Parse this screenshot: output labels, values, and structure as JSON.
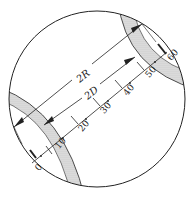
{
  "diagram": {
    "labels": {
      "outer": "2R",
      "inner": "2D"
    },
    "scale": {
      "ticks": [
        "0",
        "10",
        "20",
        "30",
        "40",
        "50",
        "60"
      ]
    },
    "colors": {
      "stroke": "#222222",
      "shade": "#cfcfcf",
      "background": "#ffffff"
    }
  }
}
